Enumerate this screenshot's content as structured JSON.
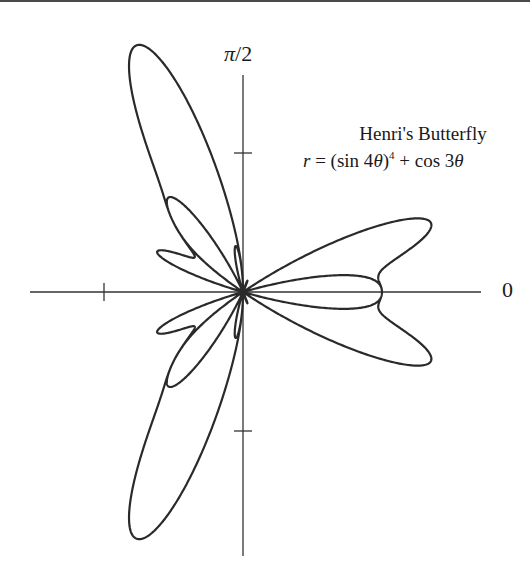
{
  "chart_data": {
    "type": "line",
    "subtype": "polar",
    "title": "Henri's Butterfly",
    "equation": "r = (sin 4θ)^4 + cos 3θ",
    "equation_parts": {
      "lhs": "r",
      "eq": " = (sin 4",
      "theta": "θ",
      "close": ")",
      "exp": "4",
      "plus": " + cos 3",
      "theta2": "θ"
    },
    "axis_labels": {
      "angle_0": "0",
      "angle_pi_over_2_pi": "π",
      "angle_pi_over_2_rest": "/2"
    },
    "ticks": {
      "negative_x": -1,
      "positive_y": 1,
      "negative_y": -1
    },
    "theta_range": [
      0,
      6.283185307
    ],
    "r_range": [
      0,
      2
    ],
    "grid": false,
    "legend": null,
    "sample_points": [
      {
        "theta_deg": 0,
        "r": 1.0
      },
      {
        "theta_deg": 30,
        "r": 0.56
      },
      {
        "theta_deg": 60,
        "r": 0.56
      },
      {
        "theta_deg": 90,
        "r": 0.0
      },
      {
        "theta_deg": 106,
        "r": 1.96
      },
      {
        "theta_deg": 180,
        "r": -1.0
      },
      {
        "theta_deg": 254,
        "r": 1.96
      },
      {
        "theta_deg": 270,
        "r": 0.0
      }
    ]
  },
  "plot": {
    "origin_x": 243,
    "origin_y": 292,
    "scale": 139,
    "x_axis": [
      30,
      481
    ],
    "y_axis": [
      75,
      556
    ],
    "line_color": "#2a2a2a",
    "axis_color": "#333333"
  }
}
